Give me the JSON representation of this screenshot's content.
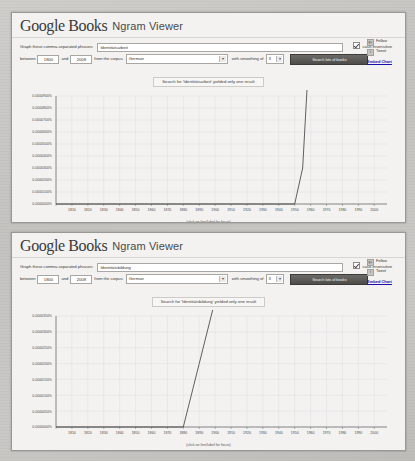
{
  "page": {
    "background_color": "#c8c6c2",
    "paper_color": "#f3f2f0"
  },
  "panels": [
    {
      "header": {
        "logo_google": "Google",
        "logo_books": "Books",
        "product_name": "Ngram Viewer"
      },
      "form": {
        "phrase_label": "Graph these comma-separated phrases:",
        "phrase_value": "Identitätsarbeit",
        "phrase_placeholder": "",
        "case_insensitive_label": "case-insensitive",
        "case_insensitive_checked": true,
        "between_label": "between",
        "year_start": "1800",
        "and_label": "and",
        "year_end": "2008",
        "corpus_label": "from the corpus",
        "corpus_value": "German",
        "smoothing_label": "with smoothing of",
        "smoothing_value": "3",
        "search_button": "Search lots of books"
      },
      "sidebar": {
        "google_plus_label": "Follow",
        "twitter_label": "Tweet",
        "embed_label": "Embed Chart"
      },
      "notice": "Search for 'Identitätsarbeit' yielded only one result",
      "x_caption": "(click on line/label for focus)"
    },
    {
      "header": {
        "logo_google": "Google",
        "logo_books": "Books",
        "product_name": "Ngram Viewer"
      },
      "form": {
        "phrase_label": "Graph these comma-separated phrases:",
        "phrase_value": "Identitätsbildung",
        "phrase_placeholder": "",
        "case_insensitive_label": "case-insensitive",
        "case_insensitive_checked": true,
        "between_label": "between",
        "year_start": "1800",
        "and_label": "and",
        "year_end": "2008",
        "corpus_label": "from the corpus",
        "corpus_value": "German",
        "smoothing_label": "with smoothing of",
        "smoothing_value": "3",
        "search_button": "Search lots of books"
      },
      "sidebar": {
        "google_plus_label": "Follow",
        "twitter_label": "Tweet",
        "embed_label": "Embed Chart"
      },
      "notice": "Search for 'Identitätsbildung' yielded only one result",
      "x_caption": "(click on line/label for focus)"
    }
  ],
  "chart_data": [
    {
      "type": "line",
      "title": "",
      "xlabel": "(click on line/label for focus)",
      "ylabel": "",
      "xlim": [
        1800,
        2008
      ],
      "ylim": [
        0,
        9e-07
      ],
      "grid": true,
      "legend_position": "right-inline-label",
      "xticks": [
        "1800",
        "1810",
        "1820",
        "1830",
        "1840",
        "1850",
        "1860",
        "1870",
        "1880",
        "1890",
        "1900",
        "1910",
        "1920",
        "1930",
        "1940",
        "1950",
        "1960",
        "1970",
        "1980",
        "1990",
        "2000"
      ],
      "yticks": [
        "0.0000900%",
        "0.0000800%",
        "0.0000700%",
        "0.0000600%",
        "0.0000500%",
        "0.0000400%",
        "0.0000300%",
        "0.0000200%",
        "0.0000100%",
        "0.0000000%"
      ],
      "series": [
        {
          "name": "Identitätsarbeit",
          "x": [
            1800,
            1810,
            1820,
            1830,
            1840,
            1850,
            1860,
            1870,
            1880,
            1890,
            1900,
            1910,
            1920,
            1930,
            1940,
            1950,
            1955,
            1960,
            1963,
            1966,
            1969,
            1972,
            1975,
            1978,
            1981,
            1984,
            1987,
            1990,
            1993,
            1996,
            1999,
            2002,
            2004,
            2006,
            2008
          ],
          "values": [
            0,
            0,
            0,
            0,
            0,
            0,
            0,
            0,
            0,
            0,
            0,
            0,
            0,
            0,
            0,
            0,
            3e-07,
            1.5e-06,
            3e-06,
            2.6e-06,
            3.4e-06,
            3.2e-06,
            3.6e-06,
            5e-06,
            8.5e-06,
            1.15e-05,
            1.2e-05,
            1.75e-05,
            2.5e-05,
            3.3e-05,
            4.4e-05,
            5.7e-05,
            7.2e-05,
            8e-05,
            8.05e-05
          ]
        }
      ]
    },
    {
      "type": "line",
      "title": "",
      "xlabel": "(click on line/label for focus)",
      "ylabel": "",
      "xlim": [
        1800,
        2008
      ],
      "ylim": [
        0,
        3.5e-07
      ],
      "grid": true,
      "legend_position": "right-inline-label",
      "xticks": [
        "1800",
        "1810",
        "1820",
        "1830",
        "1840",
        "1850",
        "1860",
        "1870",
        "1880",
        "1890",
        "1900",
        "1910",
        "1920",
        "1930",
        "1940",
        "1950",
        "1960",
        "1970",
        "1980",
        "1990",
        "2000"
      ],
      "yticks": [
        "0.0000350%",
        "0.0000300%",
        "0.0000250%",
        "0.0000200%",
        "0.0000150%",
        "0.0000100%",
        "0.0000050%",
        "0.0000000%"
      ],
      "series": [
        {
          "name": "Identitätsbildung",
          "x": [
            1800,
            1810,
            1820,
            1830,
            1840,
            1850,
            1860,
            1870,
            1880,
            1890,
            1900,
            1910,
            1915,
            1920,
            1925,
            1930,
            1935,
            1940,
            1945,
            1950,
            1955,
            1958,
            1961,
            1964,
            1967,
            1970,
            1973,
            1976,
            1979,
            1982,
            1985,
            1988,
            1991,
            1994,
            1997,
            2000,
            2003,
            2005,
            2007,
            2008
          ],
          "values": [
            0,
            0,
            0,
            0,
            0,
            0,
            0,
            0,
            0,
            2e-07,
            4e-07,
            8e-07,
            1.2e-06,
            1e-06,
            7e-07,
            9e-07,
            1.1e-06,
            9e-07,
            8e-07,
            1e-06,
            1.2e-06,
            1.8e-06,
            3e-06,
            6.2e-06,
            5.5e-06,
            7.2e-06,
            1.1e-05,
            1.2e-05,
            1.18e-05,
            1.5e-05,
            1.85e-05,
            2.15e-05,
            2.45e-05,
            2.65e-05,
            2.9e-05,
            2.75e-05,
            2.98e-05,
            2.85e-05,
            3.1e-05,
            3.22e-05
          ]
        }
      ]
    }
  ]
}
